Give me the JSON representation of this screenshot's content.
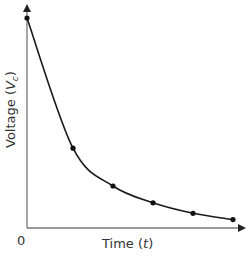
{
  "chart_data": {
    "type": "line",
    "title": "",
    "xlabel": "Time (t)",
    "ylabel": "Voltage (Vc)",
    "xlabel_parts": {
      "text": "Time (",
      "var": "t",
      "close": ")"
    },
    "ylabel_parts": {
      "text": "Voltage (",
      "var": "V",
      "sub": "c",
      "close": ")"
    },
    "origin_label": "0",
    "x_ticks": [],
    "y_ticks": [],
    "grid": false,
    "legend": null,
    "x": [
      0,
      1,
      2,
      3,
      4,
      5
    ],
    "series": [
      {
        "name": "Vc",
        "values": [
          100,
          38,
          20,
          12,
          7,
          4
        ],
        "markers": true
      }
    ],
    "xlim": [
      0,
      5.3
    ],
    "ylim": [
      0,
      103
    ],
    "colors": {
      "line": "#1a1a1a",
      "axis": "#666666",
      "text": "#333333"
    }
  }
}
